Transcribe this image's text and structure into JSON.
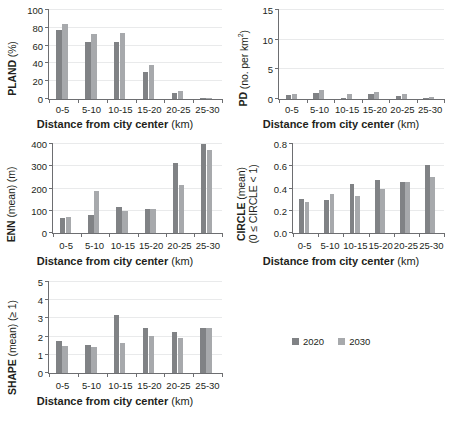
{
  "figure": {
    "shared_xlabel_bold": "Distance from city center",
    "shared_xlabel_unit": "(km)",
    "categories": [
      "0-5",
      "5-10",
      "10-15",
      "15-20",
      "20-25",
      "25-30"
    ],
    "series_names": [
      "2020",
      "2030"
    ],
    "colors": {
      "series_2020": "#808285",
      "series_2030": "#a7a9ac",
      "axis": "#6d6e71",
      "grid": "#e9eaeb",
      "text": "#231f20"
    }
  },
  "legend": {
    "position": "bottom-right",
    "items": [
      {
        "label": "2020",
        "color": "#808285"
      },
      {
        "label": "2030",
        "color": "#a7a9ac"
      }
    ]
  },
  "chart_data": [
    {
      "id": "pland",
      "type": "bar",
      "title": "",
      "ylabel_bold": "PLAND",
      "ylabel_unit": "(%)",
      "xlabel": "Distance from city center (km)",
      "categories": [
        "0-5",
        "5-10",
        "10-15",
        "15-20",
        "20-25",
        "25-30"
      ],
      "series": [
        {
          "name": "2020",
          "values": [
            78,
            64.5,
            64.5,
            30.5,
            7,
            0.7
          ]
        },
        {
          "name": "2030",
          "values": [
            84.5,
            73,
            74,
            38.5,
            9.5,
            1.5
          ]
        }
      ],
      "ylim": [
        0,
        100
      ],
      "yticks": [
        0,
        20,
        40,
        60,
        80,
        100
      ],
      "ytick_labels": [
        "0",
        "20",
        "40",
        "60",
        "80",
        "100"
      ],
      "grid": true
    },
    {
      "id": "pd",
      "type": "bar",
      "title": "",
      "ylabel_bold": "PD",
      "ylabel_unit": "(no. per km²)",
      "xlabel": "Distance from city center (km)",
      "categories": [
        "0-5",
        "5-10",
        "10-15",
        "15-20",
        "20-25",
        "25-30"
      ],
      "series": [
        {
          "name": "2020",
          "values": [
            0.7,
            1.0,
            0.2,
            0.9,
            0.5,
            0.1
          ]
        },
        {
          "name": "2030",
          "values": [
            0.9,
            1.5,
            0.8,
            1.1,
            0.8,
            0.4
          ]
        }
      ],
      "ylim": [
        0,
        15
      ],
      "yticks": [
        0,
        5,
        10,
        15
      ],
      "ytick_labels": [
        "0",
        "5",
        "10",
        "15"
      ],
      "grid": true
    },
    {
      "id": "enn",
      "type": "bar",
      "title": "",
      "ylabel_bold": "ENN",
      "ylabel_unit": "(mean) (m)",
      "xlabel": "Distance from city center (km)",
      "categories": [
        "0-5",
        "5-10",
        "10-15",
        "15-20",
        "20-25",
        "25-30"
      ],
      "series": [
        {
          "name": "2020",
          "values": [
            66,
            80,
            118,
            106,
            313,
            399
          ]
        },
        {
          "name": "2030",
          "values": [
            70,
            190,
            100,
            106,
            215,
            375
          ]
        }
      ],
      "ylim": [
        0,
        400
      ],
      "yticks": [
        0,
        100,
        200,
        300,
        400
      ],
      "ytick_labels": [
        "0",
        "100",
        "200",
        "300",
        "400"
      ],
      "grid": true
    },
    {
      "id": "circle",
      "type": "bar",
      "title": "",
      "ylabel_bold": "CIRCLE",
      "ylabel_unit": "(mean)",
      "ylabel_line2": "(0 ≤ CIRCLE < 1)",
      "xlabel": "Distance from city center (km)",
      "categories": [
        "0-5",
        "5-10",
        "10-15",
        "15-20",
        "20-25",
        "25-30"
      ],
      "series": [
        {
          "name": "2020",
          "values": [
            0.31,
            0.295,
            0.44,
            0.48,
            0.46,
            0.61
          ]
        },
        {
          "name": "2030",
          "values": [
            0.275,
            0.35,
            0.335,
            0.395,
            0.46,
            0.505
          ]
        }
      ],
      "ylim": [
        0,
        0.8
      ],
      "yticks": [
        0,
        0.2,
        0.4,
        0.6,
        0.8
      ],
      "ytick_labels": [
        "0.0",
        "0.2",
        "0.4",
        "0.6",
        "0.8"
      ],
      "grid": true
    },
    {
      "id": "shape",
      "type": "bar",
      "title": "",
      "ylabel_bold": "SHAPE",
      "ylabel_unit": "(mean) (≥ 1)",
      "xlabel": "Distance from city center (km)",
      "categories": [
        "0-5",
        "5-10",
        "10-15",
        "15-20",
        "20-25",
        "25-30"
      ],
      "series": [
        {
          "name": "2020",
          "values": [
            1.75,
            1.55,
            3.2,
            2.5,
            2.25,
            2.5
          ]
        },
        {
          "name": "2030",
          "values": [
            1.5,
            1.43,
            1.67,
            2.02,
            1.9,
            2.47
          ]
        }
      ],
      "ylim": [
        0,
        5
      ],
      "yticks": [
        0,
        1,
        2,
        3,
        4,
        5
      ],
      "ytick_labels": [
        "0",
        "1",
        "2",
        "3",
        "4",
        "5"
      ],
      "grid": true
    }
  ]
}
